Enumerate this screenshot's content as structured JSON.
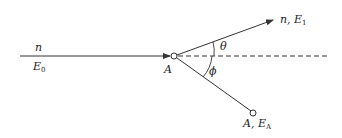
{
  "diagram": {
    "type": "scattering-schematic",
    "incident": {
      "particle_label": "n",
      "energy_label": "E",
      "energy_subscript": "0"
    },
    "target": {
      "label": "A"
    },
    "scattered": {
      "particle_label": "n, E",
      "energy_subscript": "1"
    },
    "recoil": {
      "label": "A, E",
      "energy_subscript": "A"
    },
    "angles": {
      "scatter_angle": "θ",
      "recoil_angle": "ϕ"
    },
    "colors": {
      "line": "#333333",
      "background": "#ffffff"
    }
  }
}
